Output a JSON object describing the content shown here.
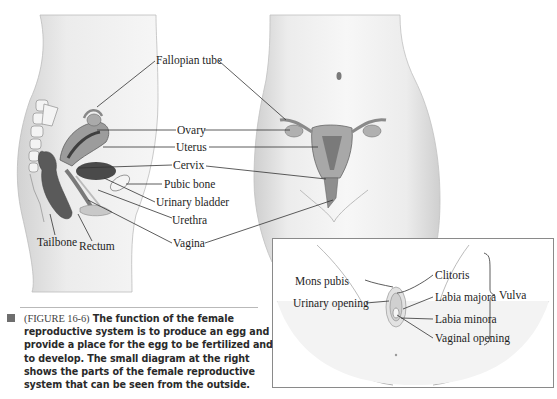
{
  "figure": {
    "id": "FIGURE 16-6",
    "caption_prefix": "(FIGURE 16-6)",
    "caption_text": "The function of the female reproductive system is to produce an egg and provide a place for the egg to be fertilized and to develop. The small diagram at the right shows the parts of the female reproductive system that can be seen from the outside."
  },
  "main_labels": {
    "fallopian_tube": "Fallopian tube",
    "ovary": "Ovary",
    "uterus": "Uterus",
    "cervix": "Cervix",
    "pubic_bone": "Pubic bone",
    "urinary_bladder": "Urinary bladder",
    "urethra": "Urethra",
    "vagina": "Vagina",
    "tailbone": "Tailbone",
    "rectum": "Rectum"
  },
  "inset_labels": {
    "mons_pubis": "Mons pubis",
    "urinary_opening": "Urinary opening",
    "clitoris": "Clitoris",
    "labia_majora": "Labia majora",
    "labia_minora": "Labia minora",
    "vaginal_opening": "Vaginal opening",
    "vulva": "Vulva"
  }
}
